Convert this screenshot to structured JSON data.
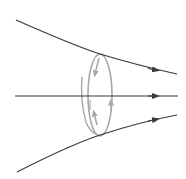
{
  "diagram": {
    "colors": {
      "field_line": "#3a3a3a",
      "loop": "#a8a8a8",
      "background": "#ffffff"
    },
    "field_lines": [
      {
        "id": "top",
        "direction": "right"
      },
      {
        "id": "middle",
        "direction": "right"
      },
      {
        "id": "bottom",
        "direction": "right"
      }
    ],
    "loop": {
      "shape": "ellipse",
      "circulation_arrows": 4
    }
  }
}
